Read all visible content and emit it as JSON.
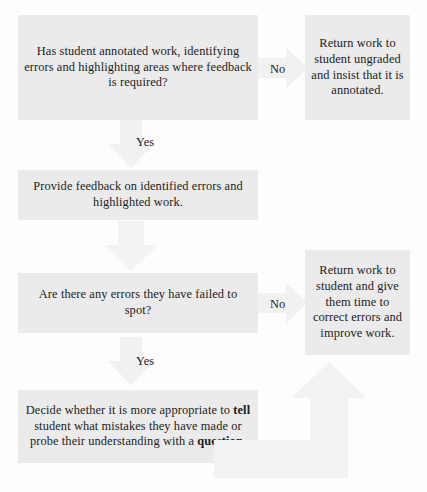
{
  "diagram": {
    "palette": {
      "box_fill": "#ebebeb",
      "arrow_fill": "#f1f1f1",
      "text": "#1b1b1b",
      "background": "#fdfdfd"
    },
    "nodes": {
      "annotated": {
        "id": "has-student-annotated-work",
        "type": "decision",
        "text": "Has student annotated work, identifying errors and highlighting areas where feedback is required?"
      },
      "return_ungraded": {
        "id": "return-work-ungraded",
        "type": "outcome",
        "text": "Return work to student ungraded and insist that it is annotated."
      },
      "provide_feedback": {
        "id": "provide-feedback",
        "type": "process",
        "text": "Provide feedback on identified errors and highlighted work."
      },
      "errors_missed": {
        "id": "are-there-any-errors",
        "type": "decision",
        "text": "Are there any errors they have failed to spot?"
      },
      "return_correct": {
        "id": "return-work-to-correct",
        "type": "outcome",
        "text": "Return work to student and give them time to correct errors and improve work."
      },
      "decide_tell_or_question": {
        "id": "decide-tell-or-question",
        "type": "process",
        "text_parts": [
          {
            "text": "Decide whether it is more appropriate to ",
            "bold": false
          },
          {
            "text": "tell",
            "bold": true
          },
          {
            "text": " student what mistakes they have made or probe their understanding with a ",
            "bold": false
          },
          {
            "text": "question",
            "bold": true
          },
          {
            "text": ".",
            "bold": false
          }
        ]
      }
    },
    "edges": {
      "no_1": {
        "label": "No",
        "from": "has-student-annotated-work",
        "to": "return-work-ungraded",
        "direction": "right"
      },
      "yes_1": {
        "label": "Yes",
        "from": "has-student-annotated-work",
        "to": "provide-feedback",
        "direction": "down"
      },
      "flow_1": {
        "label": "",
        "from": "provide-feedback",
        "to": "are-there-any-errors",
        "direction": "down"
      },
      "no_2": {
        "label": "No",
        "from": "are-there-any-errors",
        "to": "return-work-to-correct",
        "direction": "right"
      },
      "yes_2": {
        "label": "Yes",
        "from": "are-there-any-errors",
        "to": "decide-tell-or-question",
        "direction": "down"
      },
      "loop_back": {
        "label": "",
        "from": "decide-tell-or-question",
        "to": "return-work-to-correct",
        "direction": "right-then-up"
      }
    }
  }
}
